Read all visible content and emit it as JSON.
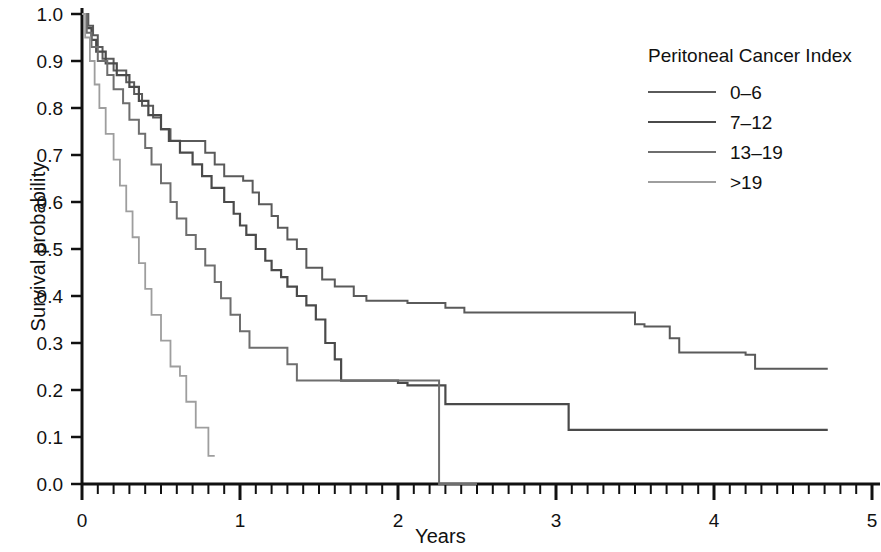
{
  "chart_data": {
    "type": "line",
    "subtype": "kaplan-meier-step",
    "title": "",
    "xlabel": "Years",
    "ylabel": "Survival probability",
    "xlim": [
      0,
      5
    ],
    "ylim": [
      0,
      1.0
    ],
    "xticks": [
      0,
      1,
      2,
      3,
      4,
      5
    ],
    "xticklabels": [
      "0",
      "1",
      "2",
      "3",
      "4",
      "5"
    ],
    "xminor_tick_step": 0.1,
    "yticks": [
      0.0,
      0.1,
      0.2,
      0.3,
      0.4,
      0.5,
      0.6,
      0.7,
      0.8,
      0.9,
      1.0
    ],
    "yticklabels": [
      "0.0",
      "0.1",
      "0.2",
      "0.3",
      "0.4",
      "0.5",
      "0.6",
      "0.7",
      "0.8",
      "0.9",
      "1.0"
    ],
    "grid": false,
    "legend_position": "top-right",
    "legend_title": "Peritoneal Cancer Index",
    "series": [
      {
        "name": "0-6",
        "label": "0–6",
        "color": "#5a5a5a",
        "linewidth": 2.0,
        "points": [
          [
            0.0,
            1.0
          ],
          [
            0.04,
            0.975
          ],
          [
            0.07,
            0.955
          ],
          [
            0.1,
            0.93
          ],
          [
            0.13,
            0.905
          ],
          [
            0.2,
            0.88
          ],
          [
            0.28,
            0.855
          ],
          [
            0.33,
            0.83
          ],
          [
            0.38,
            0.805
          ],
          [
            0.45,
            0.78
          ],
          [
            0.5,
            0.755
          ],
          [
            0.56,
            0.73
          ],
          [
            0.78,
            0.705
          ],
          [
            0.84,
            0.68
          ],
          [
            0.9,
            0.655
          ],
          [
            1.02,
            0.645
          ],
          [
            1.08,
            0.62
          ],
          [
            1.12,
            0.595
          ],
          [
            1.2,
            0.57
          ],
          [
            1.24,
            0.545
          ],
          [
            1.3,
            0.52
          ],
          [
            1.36,
            0.5
          ],
          [
            1.42,
            0.46
          ],
          [
            1.52,
            0.435
          ],
          [
            1.6,
            0.42
          ],
          [
            1.72,
            0.4
          ],
          [
            1.8,
            0.39
          ],
          [
            2.06,
            0.385
          ],
          [
            2.3,
            0.375
          ],
          [
            2.42,
            0.365
          ],
          [
            3.5,
            0.34
          ],
          [
            3.56,
            0.335
          ],
          [
            3.72,
            0.31
          ],
          [
            3.78,
            0.28
          ],
          [
            4.2,
            0.275
          ],
          [
            4.26,
            0.245
          ],
          [
            4.72,
            0.245
          ]
        ],
        "final_value": 0.245,
        "max_followup": 4.72
      },
      {
        "name": "7-12",
        "label": "7–12",
        "color": "#4a4a4a",
        "linewidth": 2.2,
        "points": [
          [
            0.0,
            1.0
          ],
          [
            0.03,
            0.97
          ],
          [
            0.06,
            0.945
          ],
          [
            0.09,
            0.92
          ],
          [
            0.15,
            0.895
          ],
          [
            0.22,
            0.87
          ],
          [
            0.3,
            0.845
          ],
          [
            0.36,
            0.815
          ],
          [
            0.42,
            0.785
          ],
          [
            0.5,
            0.755
          ],
          [
            0.55,
            0.73
          ],
          [
            0.62,
            0.705
          ],
          [
            0.7,
            0.68
          ],
          [
            0.76,
            0.655
          ],
          [
            0.82,
            0.63
          ],
          [
            0.9,
            0.6
          ],
          [
            0.96,
            0.575
          ],
          [
            1.0,
            0.55
          ],
          [
            1.04,
            0.53
          ],
          [
            1.1,
            0.5
          ],
          [
            1.16,
            0.475
          ],
          [
            1.2,
            0.455
          ],
          [
            1.26,
            0.44
          ],
          [
            1.3,
            0.42
          ],
          [
            1.36,
            0.4
          ],
          [
            1.42,
            0.38
          ],
          [
            1.48,
            0.35
          ],
          [
            1.54,
            0.3
          ],
          [
            1.6,
            0.265
          ],
          [
            1.64,
            0.22
          ],
          [
            2.0,
            0.215
          ],
          [
            2.06,
            0.21
          ],
          [
            2.24,
            0.21
          ],
          [
            2.3,
            0.17
          ],
          [
            3.02,
            0.17
          ],
          [
            3.08,
            0.115
          ],
          [
            4.72,
            0.115
          ]
        ],
        "final_value": 0.115,
        "max_followup": 4.72
      },
      {
        "name": "13-19",
        "label": "13–19",
        "color": "#6e6e6e",
        "linewidth": 2.0,
        "points": [
          [
            0.0,
            1.0
          ],
          [
            0.03,
            0.96
          ],
          [
            0.06,
            0.93
          ],
          [
            0.1,
            0.9
          ],
          [
            0.16,
            0.87
          ],
          [
            0.2,
            0.84
          ],
          [
            0.26,
            0.81
          ],
          [
            0.3,
            0.775
          ],
          [
            0.36,
            0.745
          ],
          [
            0.4,
            0.715
          ],
          [
            0.44,
            0.68
          ],
          [
            0.5,
            0.64
          ],
          [
            0.56,
            0.6
          ],
          [
            0.6,
            0.565
          ],
          [
            0.66,
            0.53
          ],
          [
            0.72,
            0.5
          ],
          [
            0.78,
            0.465
          ],
          [
            0.84,
            0.43
          ],
          [
            0.88,
            0.395
          ],
          [
            0.94,
            0.36
          ],
          [
            1.0,
            0.325
          ],
          [
            1.06,
            0.29
          ],
          [
            1.26,
            0.29
          ],
          [
            1.3,
            0.255
          ],
          [
            1.36,
            0.22
          ],
          [
            2.24,
            0.22
          ],
          [
            2.26,
            0.0
          ],
          [
            2.5,
            0.0
          ]
        ],
        "final_value": 0.0,
        "max_followup": 2.5
      },
      {
        "name": ">19",
        "label": ">19",
        "color": "#9e9e9e",
        "linewidth": 1.8,
        "points": [
          [
            0.0,
            1.0
          ],
          [
            0.02,
            0.95
          ],
          [
            0.05,
            0.9
          ],
          [
            0.08,
            0.85
          ],
          [
            0.11,
            0.8
          ],
          [
            0.15,
            0.745
          ],
          [
            0.2,
            0.69
          ],
          [
            0.24,
            0.635
          ],
          [
            0.28,
            0.58
          ],
          [
            0.32,
            0.525
          ],
          [
            0.36,
            0.47
          ],
          [
            0.4,
            0.415
          ],
          [
            0.44,
            0.36
          ],
          [
            0.5,
            0.305
          ],
          [
            0.56,
            0.25
          ],
          [
            0.62,
            0.23
          ],
          [
            0.66,
            0.175
          ],
          [
            0.72,
            0.12
          ],
          [
            0.78,
            0.12
          ],
          [
            0.8,
            0.06
          ],
          [
            0.84,
            0.06
          ]
        ],
        "final_value": 0.06,
        "max_followup": 0.84
      }
    ]
  },
  "legend": {
    "title": "Peritoneal Cancer Index",
    "entries": [
      {
        "label": "0–6",
        "color": "#5a5a5a"
      },
      {
        "label": "7–12",
        "color": "#4a4a4a"
      },
      {
        "label": "13–19",
        "color": "#6e6e6e"
      },
      {
        "label": ">19",
        "color": "#9e9e9e"
      }
    ]
  },
  "axes": {
    "x_title": "Years",
    "y_title": "Survival probability"
  }
}
